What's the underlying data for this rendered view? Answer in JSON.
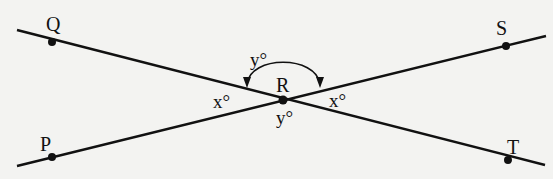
{
  "diagram": {
    "type": "intersecting-lines",
    "points": {
      "Q": {
        "label": "Q",
        "x": 52,
        "y": 42
      },
      "S": {
        "label": "S",
        "x": 506,
        "y": 46
      },
      "P": {
        "label": "P",
        "x": 52,
        "y": 157
      },
      "T": {
        "label": "T",
        "x": 508,
        "y": 157
      },
      "R": {
        "label": "R",
        "x": 283,
        "y": 100
      }
    },
    "lines": [
      {
        "name": "QT",
        "from": [
          17,
          30
        ],
        "to": [
          545,
          165
        ]
      },
      {
        "name": "PS",
        "from": [
          17,
          166
        ],
        "to": [
          546,
          36
        ]
      }
    ],
    "angles": {
      "left": "x°",
      "right": "x°",
      "top": "y°",
      "bottom": "y°"
    },
    "colors": {
      "ink": "#111111",
      "background": "#f3f3f1"
    }
  }
}
